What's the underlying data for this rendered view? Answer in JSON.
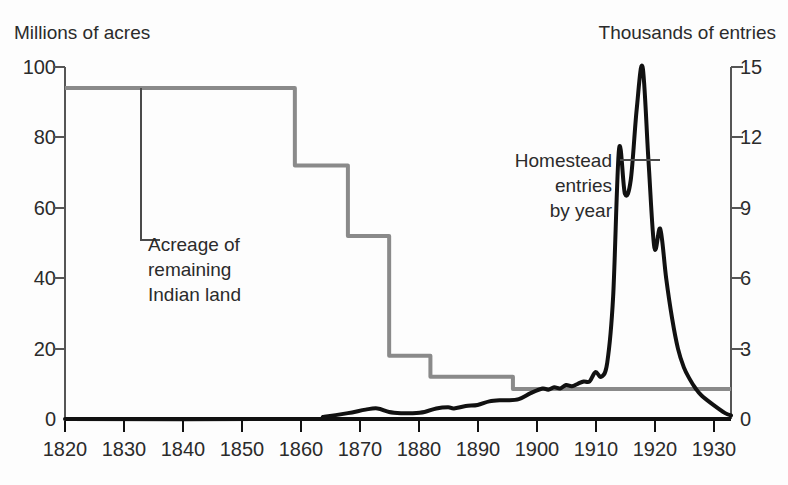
{
  "chart_data": {
    "type": "line",
    "title": "",
    "xlabel": "",
    "x_ticks": [
      1820,
      1830,
      1840,
      1850,
      1860,
      1870,
      1880,
      1890,
      1900,
      1910,
      1920,
      1930
    ],
    "xlim": [
      1820,
      1933
    ],
    "left_axis": {
      "label": "Millions of acres",
      "ticks": [
        0,
        20,
        40,
        60,
        80,
        100
      ],
      "ylim": [
        0,
        100
      ],
      "color": "#8a8a8a"
    },
    "right_axis": {
      "label": "Thousands of entries",
      "ticks": [
        0,
        3,
        6,
        9,
        12,
        15
      ],
      "ylim": [
        0,
        15
      ],
      "color": "#111111"
    },
    "grid": false,
    "legend": "none (inline annotations)",
    "series": [
      {
        "name": "Acreage of remaining Indian land",
        "axis": "left",
        "units": "millions of acres",
        "style": "step",
        "color": "#8a8a8a",
        "points": [
          {
            "x": 1820,
            "y": 94
          },
          {
            "x": 1857,
            "y": 94
          },
          {
            "x": 1859,
            "y": 72
          },
          {
            "x": 1866,
            "y": 72
          },
          {
            "x": 1868,
            "y": 52
          },
          {
            "x": 1873,
            "y": 52
          },
          {
            "x": 1875,
            "y": 18
          },
          {
            "x": 1881,
            "y": 18
          },
          {
            "x": 1882,
            "y": 12
          },
          {
            "x": 1895,
            "y": 12
          },
          {
            "x": 1896,
            "y": 8.5
          },
          {
            "x": 1933,
            "y": 8.5
          }
        ]
      },
      {
        "name": "Homestead entries by year",
        "axis": "right",
        "units": "thousands of entries",
        "style": "line",
        "color": "#111111",
        "points": [
          {
            "x": 1820,
            "y": 0
          },
          {
            "x": 1860,
            "y": 0
          },
          {
            "x": 1864,
            "y": 0.1
          },
          {
            "x": 1868,
            "y": 0.25
          },
          {
            "x": 1871,
            "y": 0.4
          },
          {
            "x": 1873,
            "y": 0.45
          },
          {
            "x": 1875,
            "y": 0.3
          },
          {
            "x": 1877,
            "y": 0.25
          },
          {
            "x": 1879,
            "y": 0.25
          },
          {
            "x": 1881,
            "y": 0.3
          },
          {
            "x": 1883,
            "y": 0.45
          },
          {
            "x": 1885,
            "y": 0.5
          },
          {
            "x": 1886,
            "y": 0.45
          },
          {
            "x": 1888,
            "y": 0.55
          },
          {
            "x": 1890,
            "y": 0.6
          },
          {
            "x": 1892,
            "y": 0.75
          },
          {
            "x": 1894,
            "y": 0.8
          },
          {
            "x": 1895,
            "y": 0.8
          },
          {
            "x": 1897,
            "y": 0.85
          },
          {
            "x": 1899,
            "y": 1.1
          },
          {
            "x": 1901,
            "y": 1.3
          },
          {
            "x": 1902,
            "y": 1.25
          },
          {
            "x": 1903,
            "y": 1.35
          },
          {
            "x": 1904,
            "y": 1.3
          },
          {
            "x": 1905,
            "y": 1.45
          },
          {
            "x": 1906,
            "y": 1.4
          },
          {
            "x": 1907,
            "y": 1.5
          },
          {
            "x": 1908,
            "y": 1.6
          },
          {
            "x": 1909,
            "y": 1.6
          },
          {
            "x": 1910,
            "y": 2.0
          },
          {
            "x": 1911,
            "y": 1.8
          },
          {
            "x": 1912,
            "y": 2.4
          },
          {
            "x": 1913,
            "y": 5.2
          },
          {
            "x": 1914,
            "y": 11.5
          },
          {
            "x": 1915,
            "y": 9.6
          },
          {
            "x": 1916,
            "y": 10.2
          },
          {
            "x": 1917,
            "y": 13.2
          },
          {
            "x": 1918,
            "y": 15.0
          },
          {
            "x": 1919,
            "y": 11.0
          },
          {
            "x": 1920,
            "y": 7.3
          },
          {
            "x": 1921,
            "y": 8.1
          },
          {
            "x": 1922,
            "y": 6.0
          },
          {
            "x": 1923,
            "y": 4.3
          },
          {
            "x": 1924,
            "y": 3.0
          },
          {
            "x": 1925,
            "y": 2.2
          },
          {
            "x": 1926,
            "y": 1.7
          },
          {
            "x": 1927,
            "y": 1.3
          },
          {
            "x": 1928,
            "y": 1.0
          },
          {
            "x": 1930,
            "y": 0.6
          },
          {
            "x": 1932,
            "y": 0.25
          },
          {
            "x": 1933,
            "y": 0.15
          }
        ]
      }
    ],
    "annotations": [
      {
        "name": "acreage-annotation",
        "text": "Acreage of\nremaining\nIndian land",
        "leader": "elbow from gray line at 1833 down to label"
      },
      {
        "name": "homestead-annotation",
        "text": "Homestead\nentries\nby year",
        "leader": "horizontal to black curve near 1914"
      }
    ]
  }
}
